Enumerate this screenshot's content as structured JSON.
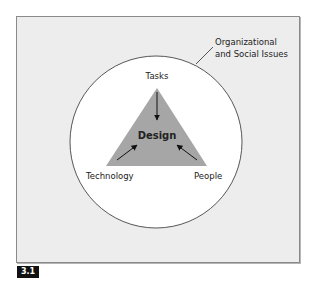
{
  "figure": {
    "number": "3.1",
    "context_label_line1": "Organizational",
    "context_label_line2": "and Social Issues",
    "center_label": "Design",
    "vertices": {
      "top": "Tasks",
      "bottom_left": "Technology",
      "bottom_right": "People"
    },
    "colors": {
      "background": "#ededed",
      "circle_fill": "#ffffff",
      "triangle_fill": "#a6a6a6",
      "arrow": "#111111",
      "tag_bg": "#111111"
    }
  }
}
